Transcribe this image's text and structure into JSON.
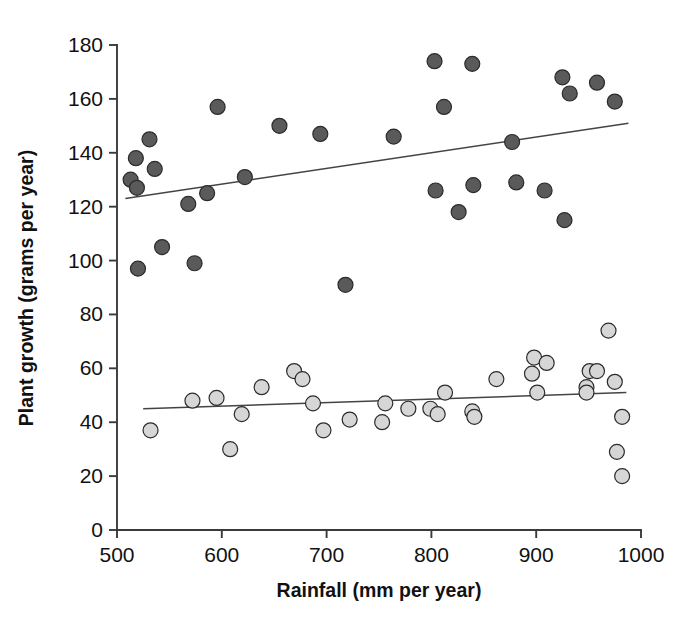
{
  "chart_data": {
    "type": "scatter",
    "title": "",
    "xlabel": "Rainfall (mm per year)",
    "ylabel": "Plant growth (grams per year)",
    "xlim": [
      500,
      1000
    ],
    "ylim": [
      0,
      180
    ],
    "xticks": [
      500,
      600,
      700,
      800,
      900,
      1000
    ],
    "yticks": [
      0,
      20,
      40,
      60,
      80,
      100,
      120,
      140,
      160,
      180
    ],
    "xtick_labels": [
      "500",
      "600",
      "700",
      "800",
      "900",
      "1000"
    ],
    "ytick_labels": [
      "0",
      "20",
      "40",
      "60",
      "80",
      "100",
      "120",
      "140",
      "160",
      "180"
    ],
    "grid": false,
    "legend": "none",
    "colors": {
      "series_dark_fill": "#5a5a5a",
      "series_light_fill": "#d6d6d6",
      "marker_edge": "#2b2b2b",
      "fit_line": "#444444",
      "axis": "#3a3a3a",
      "text": "#111111",
      "background": "#ffffff"
    },
    "series": [
      {
        "name": "High growth group",
        "marker": "filled-dark-circle",
        "fill": "#5a5a5a",
        "edge": "#2b2b2b",
        "radius": 7.5,
        "points": [
          [
            513,
            130
          ],
          [
            518,
            138
          ],
          [
            519,
            127
          ],
          [
            520,
            97
          ],
          [
            531,
            145
          ],
          [
            536,
            134
          ],
          [
            543,
            105
          ],
          [
            568,
            121
          ],
          [
            574,
            99
          ],
          [
            586,
            125
          ],
          [
            596,
            157
          ],
          [
            622,
            131
          ],
          [
            655,
            150
          ],
          [
            694,
            147
          ],
          [
            718,
            91
          ],
          [
            764,
            146
          ],
          [
            803,
            174
          ],
          [
            804,
            126
          ],
          [
            812,
            157
          ],
          [
            826,
            118
          ],
          [
            839,
            173
          ],
          [
            840,
            128
          ],
          [
            877,
            144
          ],
          [
            881,
            129
          ],
          [
            908,
            126
          ],
          [
            925,
            168
          ],
          [
            927,
            115
          ],
          [
            932,
            162
          ],
          [
            958,
            166
          ],
          [
            975,
            159
          ]
        ],
        "fit_line": {
          "x1": 508,
          "y1": 123,
          "x2": 988,
          "y2": 151
        }
      },
      {
        "name": "Low growth group",
        "marker": "filled-light-circle",
        "fill": "#d6d6d6",
        "edge": "#2b2b2b",
        "radius": 7.5,
        "points": [
          [
            532,
            37
          ],
          [
            572,
            48
          ],
          [
            595,
            49
          ],
          [
            608,
            30
          ],
          [
            619,
            43
          ],
          [
            638,
            53
          ],
          [
            669,
            59
          ],
          [
            677,
            56
          ],
          [
            687,
            47
          ],
          [
            697,
            37
          ],
          [
            722,
            41
          ],
          [
            753,
            40
          ],
          [
            756,
            47
          ],
          [
            778,
            45
          ],
          [
            799,
            45
          ],
          [
            806,
            43
          ],
          [
            813,
            51
          ],
          [
            839,
            44
          ],
          [
            841,
            42
          ],
          [
            862,
            56
          ],
          [
            896,
            58
          ],
          [
            898,
            64
          ],
          [
            901,
            51
          ],
          [
            910,
            62
          ],
          [
            948,
            53
          ],
          [
            948,
            51
          ],
          [
            951,
            59
          ],
          [
            958,
            59
          ],
          [
            969,
            74
          ],
          [
            975,
            55
          ],
          [
            982,
            42
          ],
          [
            977,
            29
          ],
          [
            982,
            20
          ]
        ],
        "fit_line": {
          "x1": 525,
          "y1": 45,
          "x2": 986,
          "y2": 51
        }
      }
    ]
  }
}
